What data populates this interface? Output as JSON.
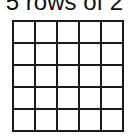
{
  "diagram": {
    "title": "5 rows of 2",
    "grid": {
      "rows": 5,
      "columns": 5,
      "line_color": "#1a1a1a",
      "fill_color": "#ffffff"
    }
  }
}
